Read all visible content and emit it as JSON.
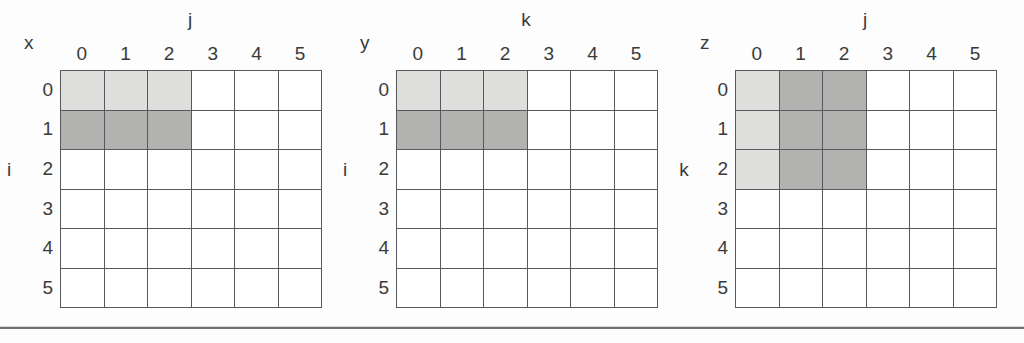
{
  "figure": {
    "panels": [
      {
        "matrix_label": "x",
        "col_axis_label": "j",
        "row_axis_label": "i",
        "col_headers": [
          "0",
          "1",
          "2",
          "3",
          "4",
          "5"
        ],
        "row_headers": [
          "0",
          "1",
          "2",
          "3",
          "4",
          "5"
        ],
        "shading": [
          [
            "light",
            "light",
            "light",
            "none",
            "none",
            "none"
          ],
          [
            "dark",
            "dark",
            "dark",
            "none",
            "none",
            "none"
          ],
          [
            "none",
            "none",
            "none",
            "none",
            "none",
            "none"
          ],
          [
            "none",
            "none",
            "none",
            "none",
            "none",
            "none"
          ],
          [
            "none",
            "none",
            "none",
            "none",
            "none",
            "none"
          ],
          [
            "none",
            "none",
            "none",
            "none",
            "none",
            "none"
          ]
        ]
      },
      {
        "matrix_label": "y",
        "col_axis_label": "k",
        "row_axis_label": "i",
        "col_headers": [
          "0",
          "1",
          "2",
          "3",
          "4",
          "5"
        ],
        "row_headers": [
          "0",
          "1",
          "2",
          "3",
          "4",
          "5"
        ],
        "shading": [
          [
            "light",
            "light",
            "light",
            "none",
            "none",
            "none"
          ],
          [
            "dark",
            "dark",
            "dark",
            "none",
            "none",
            "none"
          ],
          [
            "none",
            "none",
            "none",
            "none",
            "none",
            "none"
          ],
          [
            "none",
            "none",
            "none",
            "none",
            "none",
            "none"
          ],
          [
            "none",
            "none",
            "none",
            "none",
            "none",
            "none"
          ],
          [
            "none",
            "none",
            "none",
            "none",
            "none",
            "none"
          ]
        ]
      },
      {
        "matrix_label": "z",
        "col_axis_label": "j",
        "row_axis_label": "k",
        "col_headers": [
          "0",
          "1",
          "2",
          "3",
          "4",
          "5"
        ],
        "row_headers": [
          "0",
          "1",
          "2",
          "3",
          "4",
          "5"
        ],
        "shading": [
          [
            "light",
            "dark",
            "dark",
            "none",
            "none",
            "none"
          ],
          [
            "light",
            "dark",
            "dark",
            "none",
            "none",
            "none"
          ],
          [
            "light",
            "dark",
            "dark",
            "none",
            "none",
            "none"
          ],
          [
            "none",
            "none",
            "none",
            "none",
            "none",
            "none"
          ],
          [
            "none",
            "none",
            "none",
            "none",
            "none",
            "none"
          ],
          [
            "none",
            "none",
            "none",
            "none",
            "none",
            "none"
          ]
        ]
      }
    ],
    "colors": {
      "shade_light": "#dededd",
      "shade_dark": "#b2b2b1",
      "cell_empty": "#ffffff",
      "grid_line": "#555a5e",
      "text": "#3a3a3a",
      "page_background": "#fdfdfd",
      "footer_rule": "#6e7276"
    },
    "layout": {
      "panel_origins_x": [
        60,
        396,
        735
      ],
      "grid_top_y": 70,
      "grid_width": 262,
      "grid_height": 238,
      "footer_rule_y": 327,
      "row_axis_label_row_index": 2,
      "matrix_label_offsets": [
        {
          "x": 24,
          "y": 33
        },
        {
          "x": 360,
          "y": 33
        },
        {
          "x": 700,
          "y": 33
        }
      ],
      "col_axis_label_offsets": [
        {
          "x": 180,
          "y": 10
        },
        {
          "x": 516,
          "y": 10
        },
        {
          "x": 855,
          "y": 10
        }
      ]
    }
  }
}
